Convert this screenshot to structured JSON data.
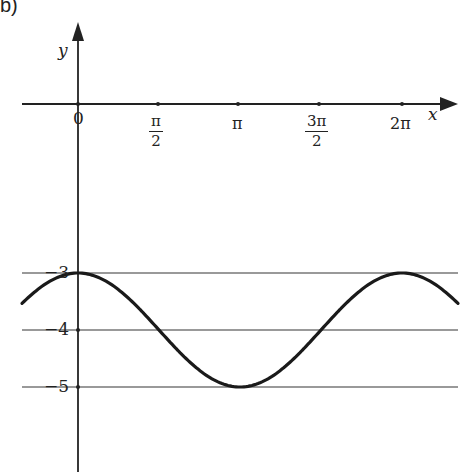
{
  "panel_label": "b)",
  "axes": {
    "x_label": "x",
    "y_label": "y",
    "origin_label": "0"
  },
  "x_ticks": [
    {
      "label_num": "π",
      "label_den": "2",
      "value": 1.5708
    },
    {
      "label": "π",
      "value": 3.1416
    },
    {
      "label_num": "3π",
      "label_den": "2",
      "value": 4.7124
    },
    {
      "label": "2π",
      "value": 6.2832
    }
  ],
  "y_ticks": [
    {
      "label": "−3",
      "value": -3
    },
    {
      "label": "−4",
      "value": -4
    },
    {
      "label": "−5",
      "value": -5
    }
  ],
  "colors": {
    "curve": "#1a1a1a",
    "axis": "#222222",
    "grid": "#777777"
  },
  "chart_data": {
    "type": "line",
    "title": "",
    "xlabel": "x",
    "ylabel": "y",
    "function": "y = cos(x) - 4",
    "x_tick_labels": [
      "0",
      "π/2",
      "π",
      "3π/2",
      "2π"
    ],
    "y_tick_labels": [
      "−3",
      "−4",
      "−5"
    ],
    "xlim": [
      -1.08,
      7.2
    ],
    "ylim": [
      -6.2,
      0.6
    ],
    "grid": "horizontal lines at y = -3, -4, -5",
    "series": [
      {
        "name": "y = cos x − 4",
        "x": [
          -1.0,
          0,
          0.7854,
          1.5708,
          2.3562,
          3.1416,
          3.927,
          4.7124,
          5.4978,
          6.2832,
          7.07
        ],
        "values": [
          -3.46,
          -3,
          -3.29,
          -4,
          -4.71,
          -5,
          -4.71,
          -4,
          -3.29,
          -3,
          -3.29
        ]
      }
    ]
  }
}
